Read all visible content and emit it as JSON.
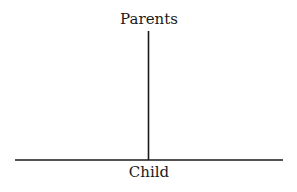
{
  "diagram": {
    "type": "tree-connector",
    "top_label": "Parents",
    "bottom_label": "Child",
    "line_color": "#1a1a1a",
    "vertical_line": {
      "x": 148.5,
      "y1": 31,
      "y2": 160
    },
    "horizontal_line": {
      "x1": 15,
      "x2": 283,
      "y": 160
    }
  }
}
